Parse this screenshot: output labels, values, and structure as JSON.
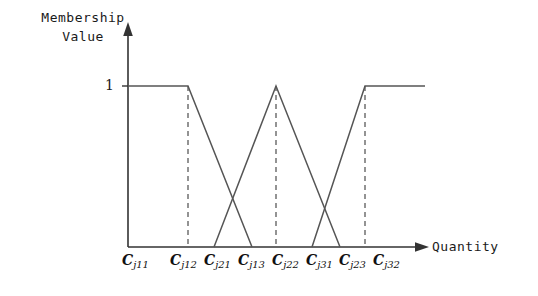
{
  "figure": {
    "type": "fuzzy-membership-function-diagram",
    "y_axis_label": "Membership\nValue",
    "y_axis_label_lines": [
      "Membership",
      "Value"
    ],
    "x_axis_label": "Quantity",
    "y_tick_label": "1",
    "line_color": "#555555",
    "dash_color": "#666666",
    "axis_color": "#333333",
    "background": "#ffffff"
  },
  "x_ticks": [
    {
      "id": "cj11",
      "base": "C",
      "sub": "j11",
      "x": 140
    },
    {
      "id": "cj12",
      "base": "C",
      "sub": "j12",
      "x": 188
    },
    {
      "id": "cj21",
      "base": "C",
      "sub": "j21",
      "x": 222
    },
    {
      "id": "cj13",
      "base": "C",
      "sub": "j13",
      "x": 256
    },
    {
      "id": "cj22",
      "base": "C",
      "sub": "j22",
      "x": 290
    },
    {
      "id": "cj31",
      "base": "C",
      "sub": "j31",
      "x": 324
    },
    {
      "id": "cj23",
      "base": "C",
      "sub": "j23",
      "x": 357
    },
    {
      "id": "cj32",
      "base": "C",
      "sub": "j32",
      "x": 391
    }
  ],
  "chart_data": {
    "type": "line",
    "title": "",
    "xlabel": "Quantity",
    "ylabel": "Membership Value",
    "ylim": [
      0,
      1
    ],
    "yticks": [
      1
    ],
    "grid": false,
    "legend": false,
    "xtick_labels": [
      "Cj11",
      "Cj12",
      "Cj21",
      "Cj13",
      "Cj22",
      "Cj31",
      "Cj23",
      "Cj32"
    ],
    "xtick_pixels": [
      140,
      188,
      214,
      252,
      276,
      312,
      340,
      365
    ],
    "dashed_guides_at": [
      "Cj12",
      "Cj22",
      "Cj32"
    ],
    "series": [
      {
        "name": "low-membership-trapezoid",
        "points": [
          [
            128,
            1
          ],
          [
            188,
            1
          ],
          [
            252,
            0
          ]
        ]
      },
      {
        "name": "medium-membership-triangle",
        "points": [
          [
            214,
            0
          ],
          [
            276,
            1
          ],
          [
            340,
            0
          ]
        ]
      },
      {
        "name": "high-membership-trapezoid",
        "points": [
          [
            312,
            0
          ],
          [
            365,
            1
          ],
          [
            425,
            1
          ]
        ]
      }
    ]
  }
}
